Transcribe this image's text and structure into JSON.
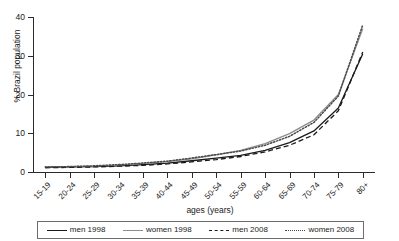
{
  "chart_data": {
    "type": "line",
    "title": "",
    "xlabel": "ages (years)",
    "ylabel": "% Brazil population",
    "categories": [
      "15-19",
      "20-24",
      "25-29",
      "30-34",
      "35-39",
      "40-44",
      "45-49",
      "50-54",
      "55-59",
      "60-64",
      "65-69",
      "70-74",
      "75-79",
      "80+"
    ],
    "ylim": [
      0,
      40
    ],
    "yticks": [
      0,
      10,
      20,
      30,
      40
    ],
    "grid": false,
    "legend_position": "bottom",
    "series": [
      {
        "name": "men 1998",
        "style": "solid",
        "color": "#1a1a1a",
        "values": [
          1.2,
          1.3,
          1.4,
          1.6,
          1.9,
          2.3,
          2.9,
          3.6,
          4.3,
          5.6,
          7.6,
          10.6,
          16.5,
          30.5
        ]
      },
      {
        "name": "women 1998",
        "style": "solid",
        "color": "#8d8d8d",
        "values": [
          1.3,
          1.4,
          1.5,
          1.8,
          2.2,
          2.7,
          3.4,
          4.4,
          5.6,
          7.3,
          9.9,
          13.4,
          20.0,
          37.0
        ]
      },
      {
        "name": "men 2008",
        "style": "dashed",
        "color": "#1a1a1a",
        "values": [
          1.1,
          1.2,
          1.3,
          1.5,
          1.7,
          2.1,
          2.6,
          3.2,
          4.0,
          5.2,
          6.9,
          9.6,
          15.8,
          31.0
        ]
      },
      {
        "name": "women 2008",
        "style": "dotted",
        "color": "#4a4a4a",
        "values": [
          1.3,
          1.4,
          1.6,
          1.9,
          2.3,
          2.8,
          3.6,
          4.5,
          5.4,
          6.9,
          9.2,
          12.8,
          19.6,
          38.0
        ]
      }
    ]
  },
  "axes": {
    "y_title": "% Brazil population",
    "x_title": "ages (years)",
    "y_tick_labels": [
      "0",
      "10",
      "20",
      "30",
      "40"
    ],
    "x_tick_labels": [
      "15-19",
      "20-24",
      "25-29",
      "30-34",
      "35-39",
      "40-44",
      "45-49",
      "50-54",
      "55-59",
      "60-64",
      "65-69",
      "70-74",
      "75-79",
      "80+"
    ]
  },
  "legend": {
    "items": [
      {
        "label": "men 1998",
        "swatch": "line-solid-dark-icon"
      },
      {
        "label": "women 1998",
        "swatch": "line-solid-gray-icon"
      },
      {
        "label": "men 2008",
        "swatch": "line-dashed-icon"
      },
      {
        "label": "women 2008",
        "swatch": "line-dotted-icon"
      }
    ]
  }
}
